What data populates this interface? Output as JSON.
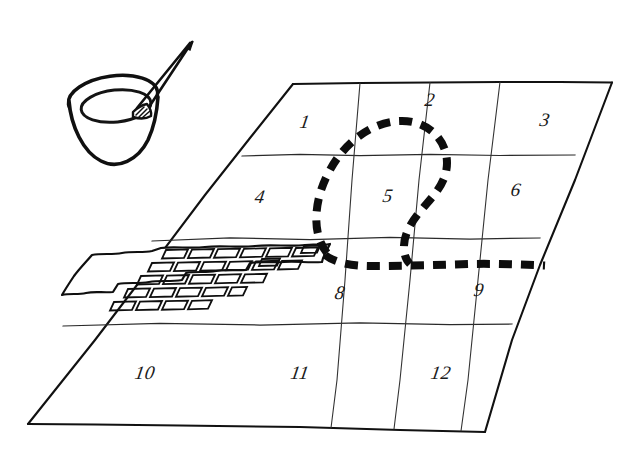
{
  "scene": {
    "title": "Hand-drawn tiled floor plan with paint bucket",
    "background_color": "#ffffff",
    "ink_color": "#111111",
    "width": 619,
    "height": 456
  },
  "grid": {
    "description": "12-cell rectangular grid drawn in perspective, 3 rows by 4 columns",
    "rows": 3,
    "columns": 4,
    "outline_color": "#111111",
    "cells": [
      {
        "label": "1",
        "x": 305,
        "y": 122
      },
      {
        "label": "2",
        "x": 430,
        "y": 100
      },
      {
        "label": "3",
        "x": 545,
        "y": 120
      },
      {
        "label": "4",
        "x": 260,
        "y": 197
      },
      {
        "label": "5",
        "x": 388,
        "y": 196
      },
      {
        "label": "6",
        "x": 516,
        "y": 190
      },
      {
        "label": "7",
        "x": 200,
        "y": 280
      },
      {
        "label": "8",
        "x": 340,
        "y": 293
      },
      {
        "label": "9",
        "x": 479,
        "y": 290
      },
      {
        "label": "10",
        "x": 145,
        "y": 373
      },
      {
        "label": "11",
        "x": 300,
        "y": 373
      },
      {
        "label": "12",
        "x": 441,
        "y": 373
      }
    ],
    "hidden_labels": [
      "7"
    ]
  },
  "paint_bucket": {
    "name": "paint bucket with brush",
    "x": 70,
    "y": 30,
    "contents": "paint",
    "brush_angle_deg": -40
  },
  "brick_area": {
    "name": "laid brick paving",
    "description": "Completed brick paving covering the left portion of the third row, cell 7 and part of cell 8",
    "fill": "hatched brick texture",
    "rows": 5,
    "bricks_per_row": 7
  },
  "dashed_outline": {
    "name": "dashed planning line",
    "description": "Thick dashed curve enclosing part of cells 2 and 5, looping down and running right along the row boundary through cell 9",
    "color": "#0d0d0d",
    "dash_length": 13,
    "dash_gap": 9,
    "stroke_width": 8
  }
}
